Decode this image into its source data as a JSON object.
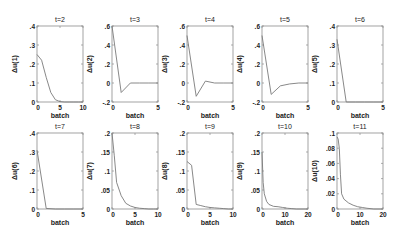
{
  "figure": {
    "rows": 2,
    "cols": 5,
    "line_color": "#7a7a7a",
    "axes_color": "#8c8c8c",
    "text_color": "#222222"
  },
  "chart_data": [
    {
      "type": "line",
      "title": "t=2",
      "xlabel": "batch",
      "ylabel": "Δu(1)",
      "xlim": [
        0,
        10
      ],
      "ylim": [
        0,
        0.4
      ],
      "xticks": [
        0,
        5,
        10
      ],
      "yticks": [
        0,
        0.1,
        0.2,
        0.3,
        0.4
      ],
      "grid": false,
      "x": [
        0,
        1,
        2,
        3,
        4,
        5,
        6,
        7,
        8,
        9,
        10
      ],
      "y": [
        0.25,
        0.22,
        0.13,
        0.05,
        0.012,
        0.002,
        0.0,
        0.0,
        0.0,
        0.0,
        0.0
      ]
    },
    {
      "type": "line",
      "title": "t=3",
      "xlabel": "batch",
      "ylabel": "Δu(2)",
      "xlim": [
        0,
        5
      ],
      "ylim": [
        -0.2,
        0.6
      ],
      "xticks": [
        0,
        5
      ],
      "yticks": [
        -0.2,
        0,
        0.2,
        0.4,
        0.6
      ],
      "grid": false,
      "x": [
        0,
        1,
        2,
        3,
        4,
        5
      ],
      "y": [
        0.6,
        -0.1,
        0.0,
        0.0,
        0.0,
        0.0
      ]
    },
    {
      "type": "line",
      "title": "t=4",
      "xlabel": "batch",
      "ylabel": "Δu(3)",
      "xlim": [
        0,
        5
      ],
      "ylim": [
        -0.2,
        0.6
      ],
      "xticks": [
        0,
        5
      ],
      "yticks": [
        -0.2,
        0,
        0.2,
        0.4,
        0.6
      ],
      "grid": false,
      "x": [
        0,
        1,
        2,
        3,
        4,
        5
      ],
      "y": [
        0.5,
        -0.14,
        0.02,
        0.0,
        0.0,
        0.0
      ]
    },
    {
      "type": "line",
      "title": "t=5",
      "xlabel": "batch",
      "ylabel": "Δu(4)",
      "xlim": [
        0,
        5
      ],
      "ylim": [
        -0.2,
        0.6
      ],
      "xticks": [
        0,
        5
      ],
      "yticks": [
        -0.2,
        0,
        0.2,
        0.4,
        0.6
      ],
      "grid": false,
      "x": [
        0,
        1,
        2,
        3,
        4,
        5
      ],
      "y": [
        0.5,
        -0.12,
        -0.03,
        -0.01,
        0.0,
        0.0
      ]
    },
    {
      "type": "line",
      "title": "t=6",
      "xlabel": "batch",
      "ylabel": "Δu(5)",
      "xlim": [
        0,
        5
      ],
      "ylim": [
        0,
        0.4
      ],
      "xticks": [
        0,
        5
      ],
      "yticks": [
        0,
        0.1,
        0.2,
        0.3,
        0.4
      ],
      "grid": false,
      "x": [
        0,
        1,
        2,
        3,
        4,
        5
      ],
      "y": [
        0.33,
        0.0,
        0.0,
        0.0,
        0.0,
        0.0
      ]
    },
    {
      "type": "line",
      "title": "t=7",
      "xlabel": "batch",
      "ylabel": "Δu(6)",
      "xlim": [
        0,
        5
      ],
      "ylim": [
        0,
        0.4
      ],
      "xticks": [
        0,
        5
      ],
      "yticks": [
        0,
        0.1,
        0.2,
        0.3,
        0.4
      ],
      "grid": false,
      "x": [
        0,
        1,
        2,
        3,
        4,
        5
      ],
      "y": [
        0.31,
        0.003,
        0.0,
        0.0,
        0.0,
        0.0
      ]
    },
    {
      "type": "line",
      "title": "t=8",
      "xlabel": "batch",
      "ylabel": "Δu(7)",
      "xlim": [
        0,
        10
      ],
      "ylim": [
        0,
        0.2
      ],
      "xticks": [
        0,
        5,
        10
      ],
      "yticks": [
        0,
        0.05,
        0.1,
        0.15,
        0.2
      ],
      "grid": false,
      "x": [
        0,
        0.5,
        1,
        2,
        3,
        4,
        5,
        6,
        7,
        8,
        9,
        10
      ],
      "y": [
        0.2,
        0.14,
        0.07,
        0.035,
        0.015,
        0.008,
        0.004,
        0.002,
        0.001,
        0.0,
        0.0,
        0.0
      ]
    },
    {
      "type": "line",
      "title": "t=9",
      "xlabel": "batch",
      "ylabel": "Δu(8)",
      "xlim": [
        0,
        10
      ],
      "ylim": [
        0,
        0.2
      ],
      "xticks": [
        0,
        5,
        10
      ],
      "yticks": [
        0,
        0.05,
        0.1,
        0.15,
        0.2
      ],
      "grid": false,
      "x": [
        0,
        1,
        2,
        3,
        4,
        5,
        6,
        7,
        8,
        9,
        10
      ],
      "y": [
        0.125,
        0.115,
        0.012,
        0.009,
        0.006,
        0.004,
        0.003,
        0.002,
        0.001,
        0.0,
        0.0
      ]
    },
    {
      "type": "line",
      "title": "t=10",
      "xlabel": "batch",
      "ylabel": "Δu(9)",
      "xlim": [
        0,
        20
      ],
      "ylim": [
        0,
        0.2
      ],
      "xticks": [
        0,
        10,
        20
      ],
      "yticks": [
        0,
        0.05,
        0.1,
        0.15,
        0.2
      ],
      "grid": false,
      "x": [
        0,
        0.5,
        1,
        2,
        3,
        5,
        7,
        9,
        11,
        13,
        15,
        20
      ],
      "y": [
        0.15,
        0.07,
        0.04,
        0.02,
        0.012,
        0.007,
        0.006,
        0.004,
        0.002,
        0.001,
        0.0,
        0.0
      ]
    },
    {
      "type": "line",
      "title": "t=11",
      "xlabel": "batch",
      "ylabel": "Δu(10)",
      "xlim": [
        0,
        20
      ],
      "ylim": [
        0,
        0.1
      ],
      "xticks": [
        0,
        10,
        20
      ],
      "yticks": [
        0,
        0.02,
        0.04,
        0.06,
        0.08,
        0.1
      ],
      "grid": false,
      "x": [
        0,
        0.5,
        1,
        1.5,
        2,
        3,
        5,
        7,
        9,
        11,
        13,
        16,
        20
      ],
      "y": [
        0.095,
        0.092,
        0.08,
        0.045,
        0.02,
        0.013,
        0.008,
        0.005,
        0.003,
        0.002,
        0.001,
        0.0,
        0.0
      ]
    }
  ]
}
